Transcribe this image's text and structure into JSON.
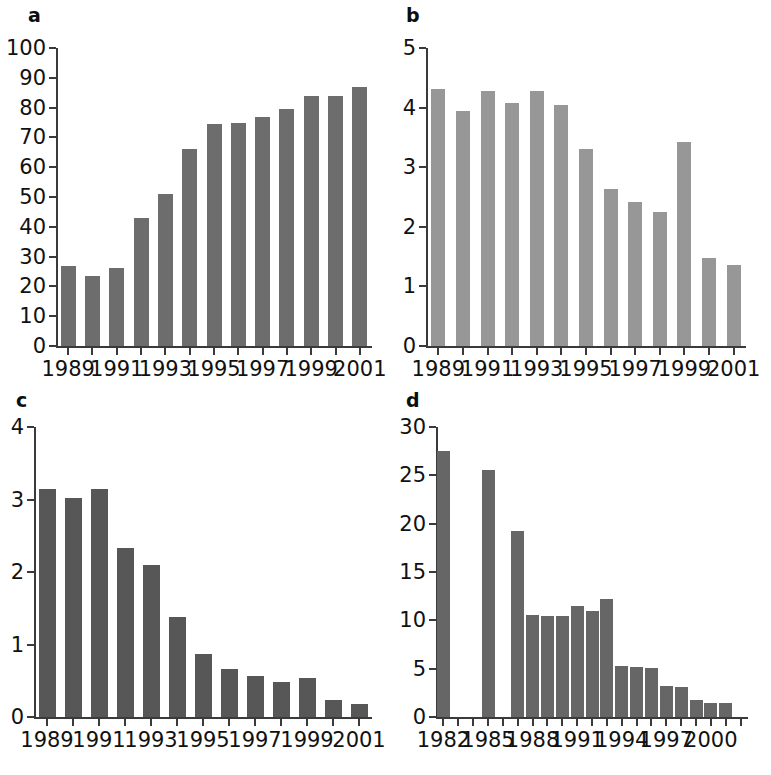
{
  "figure": {
    "background_color": "#ffffff",
    "axis_color": "#3a3a3a",
    "top_bleed_text": "",
    "panels": [
      "a",
      "b",
      "c",
      "d"
    ]
  },
  "panel_labels": {
    "a": "a",
    "b": "b",
    "c": "c",
    "d": "d"
  },
  "chart_data": [
    {
      "panel": "a",
      "type": "bar",
      "title": "",
      "xlabel": "",
      "ylabel": "",
      "bar_color": "#6d6d6d",
      "grid": false,
      "legend": null,
      "ylim": [
        0,
        100
      ],
      "yticks": [
        0,
        10,
        20,
        30,
        40,
        50,
        60,
        70,
        80,
        90,
        100
      ],
      "ytick_labels": [
        "0",
        "10",
        "20",
        "30",
        "40",
        "50",
        "60",
        "70",
        "80",
        "90",
        "100"
      ],
      "categories": [
        "1989",
        "1990",
        "1991",
        "1992",
        "1993",
        "1994",
        "1995",
        "1996",
        "1997",
        "1998",
        "1999",
        "2000",
        "2001"
      ],
      "xtick_labels_shown": [
        "1989",
        "1991",
        "1993",
        "1995",
        "1997",
        "1999",
        "2001"
      ],
      "values": [
        27.0,
        23.5,
        26.3,
        43.0,
        51.0,
        66.0,
        74.5,
        74.8,
        76.8,
        79.7,
        84.0,
        84.0,
        87.0
      ]
    },
    {
      "panel": "b",
      "type": "bar",
      "title": "",
      "xlabel": "",
      "ylabel": "",
      "bar_color": "#979797",
      "grid": false,
      "legend": null,
      "ylim": [
        0,
        5
      ],
      "yticks": [
        0,
        1,
        2,
        3,
        4,
        5
      ],
      "ytick_labels": [
        "0",
        "1",
        "2",
        "3",
        "4",
        "5"
      ],
      "categories": [
        "1989",
        "1990",
        "1991",
        "1992",
        "1993",
        "1994",
        "1995",
        "1996",
        "1997",
        "1998",
        "1999",
        "2000",
        "2001"
      ],
      "xtick_labels_shown": [
        "1989",
        "1991",
        "1993",
        "1995",
        "1997",
        "1999",
        "2001"
      ],
      "values": [
        4.32,
        3.95,
        4.28,
        4.08,
        4.28,
        4.05,
        3.3,
        2.64,
        2.42,
        2.25,
        3.42,
        1.48,
        1.36
      ]
    },
    {
      "panel": "c",
      "type": "bar",
      "title": "",
      "xlabel": "",
      "ylabel": "",
      "bar_color": "#575757",
      "grid": false,
      "legend": null,
      "ylim": [
        0,
        4
      ],
      "yticks": [
        0,
        1,
        2,
        3,
        4
      ],
      "ytick_labels": [
        "0",
        "1",
        "2",
        "3",
        "4"
      ],
      "categories": [
        "1989",
        "1990",
        "1991",
        "1992",
        "1993",
        "1994",
        "1995",
        "1996",
        "1997",
        "1998",
        "1999",
        "2000",
        "2001"
      ],
      "xtick_labels_shown": [
        "1989",
        "1991",
        "1993",
        "1995",
        "1997",
        "1999",
        "2001"
      ],
      "values": [
        3.15,
        3.02,
        3.14,
        2.33,
        2.1,
        1.38,
        0.87,
        0.66,
        0.57,
        0.48,
        0.54,
        0.24,
        0.18
      ]
    },
    {
      "panel": "d",
      "type": "bar",
      "title": "",
      "xlabel": "",
      "ylabel": "",
      "bar_color": "#666666",
      "grid": false,
      "legend": null,
      "ylim": [
        0,
        30
      ],
      "yticks": [
        0,
        5,
        10,
        15,
        20,
        25,
        30
      ],
      "ytick_labels": [
        "0",
        "5",
        "10",
        "15",
        "20",
        "25",
        "30"
      ],
      "categories": [
        "1982",
        "1983",
        "1984",
        "1985",
        "1986",
        "1987",
        "1988",
        "1989",
        "1990",
        "1991",
        "1992",
        "1993",
        "1994",
        "1995",
        "1996",
        "1997",
        "1998",
        "1999",
        "2000",
        "2001",
        "2002"
      ],
      "xtick_labels_shown": [
        "1982",
        "1985",
        "1988",
        "1991",
        "1994",
        "1997",
        "2000"
      ],
      "values": [
        27.5,
        null,
        null,
        25.6,
        null,
        19.2,
        10.6,
        10.4,
        10.4,
        11.5,
        11.0,
        12.2,
        5.3,
        5.2,
        5.1,
        3.2,
        3.1,
        1.8,
        1.5,
        1.5,
        null
      ]
    }
  ]
}
